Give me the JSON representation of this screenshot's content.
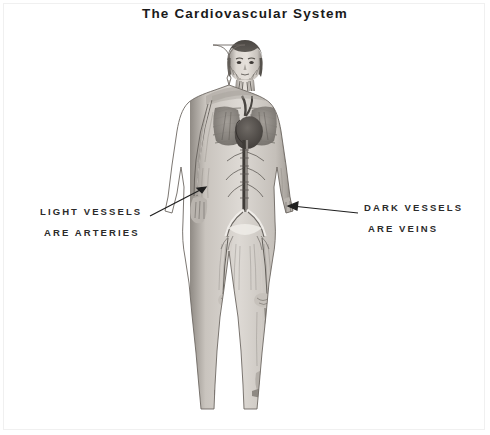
{
  "page": {
    "title": "The Cardiovascular System",
    "background_color": "#ffffff",
    "ink_color": "#2b2b2b",
    "width": 490,
    "height": 435
  },
  "illustration": {
    "name": "full-body-anterior-circulatory-figure",
    "description": "Grayscale anatomical drawing of a standing human figure, anterior view, showing the arterial and venous network of the whole body",
    "visible_structures": [
      "head",
      "face",
      "neck vessels",
      "shoulders",
      "lungs",
      "heart",
      "descending aorta",
      "abdominal vessels",
      "iliac bifurcation",
      "arms",
      "hands",
      "thighs",
      "knees",
      "lower legs",
      "feet"
    ],
    "tone_light": "#d8d4cf",
    "tone_mid": "#9a958f",
    "tone_dark": "#4a4744"
  },
  "annotations": {
    "left": {
      "line1": "LIGHT VESSELS",
      "line2": "ARE ARTERIES",
      "leader": {
        "from_x": 150,
        "from_y": 216,
        "to_x": 206,
        "to_y": 187,
        "arrowhead": "up-right"
      }
    },
    "right": {
      "line1": "DARK VESSELS",
      "line2": "ARE VEINS",
      "leader": {
        "from_x": 358,
        "from_y": 213,
        "to_x": 288,
        "to_y": 206,
        "arrowhead": "left"
      }
    }
  }
}
